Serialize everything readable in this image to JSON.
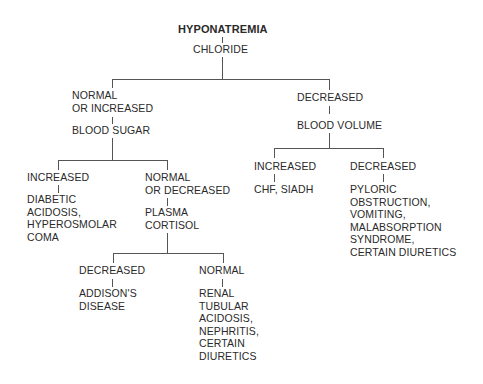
{
  "diagram": {
    "root": "HYPONATREMIA",
    "test_chloride": "CHLORIDE",
    "chloride_normal_or_increased": "NORMAL\nOR INCREASED",
    "test_blood_sugar": "BLOOD SUGAR",
    "blood_sugar_increased": "INCREASED",
    "blood_sugar_increased_result": "DIABETIC\nACIDOSIS,\nHYPEROSMOLAR\nCOMA",
    "blood_sugar_normal_or_decreased": "NORMAL\nOR DECREASED",
    "test_plasma_cortisol": "PLASMA\nCORTISOL",
    "cortisol_decreased": "DECREASED",
    "cortisol_decreased_result": "ADDISON'S\nDISEASE",
    "cortisol_normal": "NORMAL",
    "cortisol_normal_result": "RENAL\nTUBULAR\nACIDOSIS,\nNEPHRITIS,\nCERTAIN\nDIURETICS",
    "chloride_decreased": "DECREASED",
    "test_blood_volume": "BLOOD VOLUME",
    "blood_volume_increased": "INCREASED",
    "blood_volume_increased_result": "CHF, SIADH",
    "blood_volume_decreased": "DECREASED",
    "blood_volume_decreased_result": "PYLORIC\nOBSTRUCTION,\nVOMITING,\nMALABSORPTION\nSYNDROME,\nCERTAIN DIURETICS"
  },
  "colors": {
    "text": "#2a2a2a",
    "lines": "#555555",
    "background": "#ffffff"
  }
}
